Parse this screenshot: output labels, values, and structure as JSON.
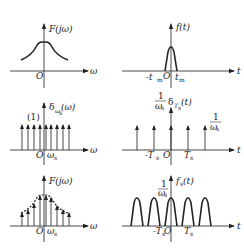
{
  "figure": {
    "panels": [
      {
        "id": "spectrum-original",
        "y_label": "F(jω)",
        "x_label": "ω",
        "origin": "O",
        "description": "bell-shaped continuous spectrum"
      },
      {
        "id": "time-signal",
        "y_label": "f(t)",
        "x_label": "t",
        "origin": "O",
        "ticks": [
          "-t",
          "t"
        ],
        "tick_sub": "m",
        "description": "narrow pulse between -t_m and t_m"
      },
      {
        "id": "impulse-train-frequency",
        "y_label_main": "δ",
        "y_label_sub": "ω",
        "y_label_subsub": "s",
        "y_label_arg": "(ω)",
        "x_label": "ω",
        "origin": "O",
        "weight": "(1)",
        "tick": "ω",
        "tick_sub": "s",
        "impulse_count": 9
      },
      {
        "id": "impulse-train-time",
        "y_label_frac_num": "1",
        "y_label_frac_den": "ω",
        "y_label_frac_den_sub": "s",
        "y_label_main": "δ",
        "y_label_sub": "T",
        "y_label_subsub": "s",
        "y_label_arg": "(t)",
        "x_label": "t",
        "origin": "O",
        "ticks": [
          "-T",
          "T"
        ],
        "tick_sub": "s",
        "height_num": "1",
        "height_den": "ω",
        "height_den_sub": "s",
        "impulse_count": 5
      },
      {
        "id": "sampled-spectrum",
        "y_label": "F(jω)",
        "x_label": "ω",
        "origin": "O",
        "tick": "ω",
        "tick_sub": "s",
        "description": "impulses weighted by bell envelope (dashed)"
      },
      {
        "id": "periodic-time-signal",
        "y_label_main": "f",
        "y_label_sub": "s",
        "y_label_arg": "(t)",
        "x_label": "t",
        "origin": "O",
        "ticks": [
          "-T",
          "T"
        ],
        "tick_sub": "s",
        "height_num": "1",
        "height_den": "ω",
        "height_den_sub": "s",
        "pulse_count": 5
      }
    ]
  }
}
